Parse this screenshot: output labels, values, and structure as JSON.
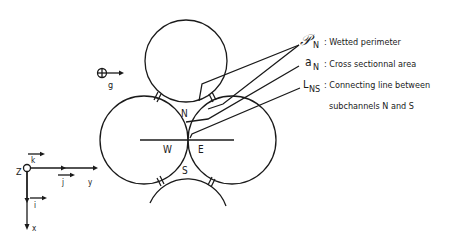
{
  "diagram": {
    "subchannels": {
      "north": "N",
      "west": "W",
      "east": "E",
      "south": "S"
    },
    "gravity": {
      "symbol": "⊕",
      "label": "g"
    },
    "axes": {
      "origin": "Z",
      "k": "k",
      "j": "j",
      "i": "i",
      "y": "y",
      "x": "x"
    },
    "legend": [
      {
        "symbol": "𝒫",
        "subscript": "N",
        "text": ": Wetted perimeter"
      },
      {
        "symbol": "a",
        "subscript": "N",
        "text": ": Cross sectionnal area"
      },
      {
        "symbol": "L",
        "subscript": "NS",
        "text": ": Connecting line between"
      },
      {
        "symbol": "",
        "subscript": "",
        "text": "subchannels  N  and  S"
      }
    ],
    "colors": {
      "line": "#1a1a1a",
      "background": "#ffffff"
    }
  }
}
